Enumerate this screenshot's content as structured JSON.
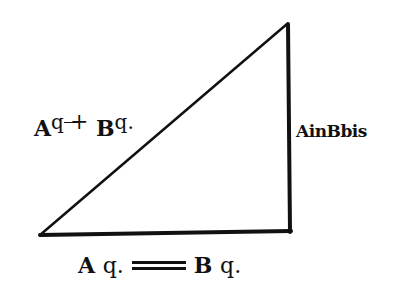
{
  "diagram": {
    "type": "right-triangle",
    "vertices": {
      "top": [
        287,
        24
      ],
      "bottom_left": [
        40,
        235
      ],
      "bottom_right": [
        290,
        232
      ]
    },
    "stroke_color": "#111111",
    "background": "#ffffff"
  },
  "labels": {
    "hypotenuse": {
      "a": "A",
      "a_exp": "q",
      "op": "+",
      "b": "B",
      "b_exp": "q."
    },
    "vertical_side": {
      "text": "AinBbis"
    },
    "base": {
      "a": "A",
      "a_q": "q.",
      "op": "=",
      "b": "B",
      "b_q": "q."
    }
  }
}
